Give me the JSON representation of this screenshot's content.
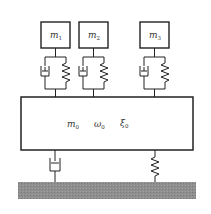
{
  "diagram": {
    "colors": {
      "line": "#222222",
      "ground": "#8a8a8a",
      "background": "#ffffff"
    },
    "masses": [
      {
        "id": "m1",
        "symbol": "m",
        "subscript": "1"
      },
      {
        "id": "m2",
        "symbol": "m",
        "subscript": "2"
      },
      {
        "id": "m3",
        "symbol": "m",
        "subscript": "3"
      }
    ],
    "main_body": {
      "labels": [
        {
          "symbol": "m",
          "subscript": "0"
        },
        {
          "symbol": "ω",
          "subscript": "0"
        },
        {
          "symbol": "ξ",
          "subscript": "0"
        }
      ]
    },
    "connectors": {
      "upper": [
        "damper+spring",
        "damper+spring",
        "damper+spring"
      ],
      "lower": [
        "damper",
        "spring"
      ]
    },
    "ground": {
      "pattern": "hatched-gray"
    }
  }
}
